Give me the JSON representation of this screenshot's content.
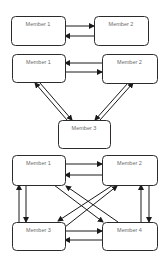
{
  "diagrams": [
    {
      "name": "two-member",
      "nodes": [
        {
          "id": "m1",
          "label": "Member 1",
          "x": 11,
          "y": 16,
          "w": 54,
          "h": 29
        },
        {
          "id": "m2",
          "label": "Member 2",
          "x": 94,
          "y": 16,
          "w": 54,
          "h": 29
        }
      ],
      "edges": [
        {
          "from": "m1",
          "to": "m2",
          "x1": 65,
          "y1": 26,
          "x2": 94,
          "y2": 26
        },
        {
          "from": "m2",
          "to": "m1",
          "x1": 94,
          "y1": 36,
          "x2": 65,
          "y2": 36
        }
      ]
    },
    {
      "name": "three-member",
      "nodes": [
        {
          "id": "m1",
          "label": "Member 1",
          "x": 12,
          "y": 54,
          "w": 53,
          "h": 28
        },
        {
          "id": "m2",
          "label": "Member 2",
          "x": 102,
          "y": 54,
          "w": 55,
          "h": 29
        },
        {
          "id": "m3",
          "label": "Member 3",
          "x": 58,
          "y": 120,
          "w": 52,
          "h": 28
        }
      ],
      "edges": [
        {
          "from": "m2",
          "to": "m1",
          "x1": 102,
          "y1": 63,
          "x2": 65,
          "y2": 63
        },
        {
          "from": "m1",
          "to": "m2",
          "x1": 65,
          "y1": 72,
          "x2": 102,
          "y2": 72
        },
        {
          "from": "m3",
          "to": "m1",
          "x1": 67,
          "y1": 120,
          "x2": 35,
          "y2": 83
        },
        {
          "from": "m1",
          "to": "m3",
          "x1": 40,
          "y1": 83,
          "x2": 72,
          "y2": 120
        },
        {
          "from": "m3",
          "to": "m2",
          "x1": 100,
          "y1": 120,
          "x2": 133,
          "y2": 83
        },
        {
          "from": "m2",
          "to": "m3",
          "x1": 128,
          "y1": 83,
          "x2": 95,
          "y2": 120
        }
      ]
    },
    {
      "name": "four-member",
      "nodes": [
        {
          "id": "m1",
          "label": "Member 1",
          "x": 12,
          "y": 155,
          "w": 53,
          "h": 30
        },
        {
          "id": "m2",
          "label": "Member 2",
          "x": 102,
          "y": 155,
          "w": 55,
          "h": 30
        },
        {
          "id": "m3",
          "label": "Member 3",
          "x": 12,
          "y": 222,
          "w": 53,
          "h": 28
        },
        {
          "id": "m4",
          "label": "Member 4",
          "x": 102,
          "y": 222,
          "w": 55,
          "h": 28
        }
      ],
      "edges": [
        {
          "from": "m1",
          "to": "m2",
          "x1": 65,
          "y1": 164,
          "x2": 102,
          "y2": 164
        },
        {
          "from": "m2",
          "to": "m1",
          "x1": 102,
          "y1": 175,
          "x2": 65,
          "y2": 175
        },
        {
          "from": "m3",
          "to": "m4",
          "x1": 65,
          "y1": 231,
          "x2": 102,
          "y2": 231
        },
        {
          "from": "m4",
          "to": "m3",
          "x1": 102,
          "y1": 240,
          "x2": 65,
          "y2": 240
        },
        {
          "from": "m3",
          "to": "m1",
          "x1": 19,
          "y1": 222,
          "x2": 19,
          "y2": 185
        },
        {
          "from": "m1",
          "to": "m3",
          "x1": 26,
          "y1": 185,
          "x2": 26,
          "y2": 222
        },
        {
          "from": "m4",
          "to": "m2",
          "x1": 141,
          "y1": 222,
          "x2": 141,
          "y2": 185
        },
        {
          "from": "m2",
          "to": "m4",
          "x1": 149,
          "y1": 185,
          "x2": 149,
          "y2": 222
        },
        {
          "from": "m1",
          "to": "m4",
          "x1": 54,
          "y1": 185,
          "x2": 103,
          "y2": 222
        },
        {
          "from": "m4",
          "to": "m1",
          "x1": 118,
          "y1": 222,
          "x2": 66,
          "y2": 186
        },
        {
          "from": "m2",
          "to": "m3",
          "x1": 113,
          "y1": 185,
          "x2": 58,
          "y2": 221
        },
        {
          "from": "m3",
          "to": "m2",
          "x1": 65,
          "y1": 227,
          "x2": 117,
          "y2": 186
        }
      ]
    }
  ]
}
